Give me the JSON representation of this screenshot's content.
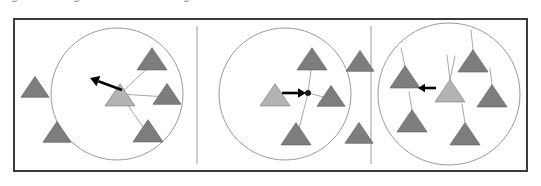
{
  "caption": {
    "text": "Figure: flocking / leader-follower neighbourhood states"
  },
  "figure": {
    "frame": {
      "x": 13,
      "y": 18,
      "w": 515,
      "h": 154,
      "border_color": "#3b3b3b",
      "border_width": 2
    },
    "background_color": "#ffffff",
    "divider_color": "#9a9a9a",
    "dividers": [
      197,
      371
    ],
    "colors": {
      "agent_fill": "#b3b3b3",
      "agent_stroke": "#8c8c8c",
      "neighbor_fill": "#7d7d7d",
      "neighbor_stroke": "#6a6a6a",
      "link": "#a8a8a8",
      "circle_stroke": "#9a9a9a",
      "arrow": "#000000",
      "hub_dot": "#1a1a1a"
    },
    "panels": [
      {
        "id": "panel-1",
        "label": "a",
        "circle": {
          "cx": 117,
          "cy": 94,
          "r": 66
        },
        "hub": null,
        "agent": {
          "x": 120,
          "y": 96,
          "size": 15,
          "rot": 0
        },
        "arrow": {
          "x1": 122,
          "y1": 90,
          "x2": 90,
          "y2": 78,
          "head": 9
        },
        "neighbors_inside": [
          {
            "x": 152,
            "y": 60,
            "size": 15,
            "rot": 0
          },
          {
            "x": 167,
            "y": 95,
            "size": 14,
            "rot": 0
          },
          {
            "x": 148,
            "y": 132,
            "size": 15,
            "rot": 0
          }
        ],
        "neighbors_outside": [
          {
            "x": 35,
            "y": 88,
            "size": 14,
            "rot": 0
          },
          {
            "x": 57,
            "y": 133,
            "size": 14,
            "rot": 0
          }
        ],
        "links": [
          {
            "x1": 120,
            "y1": 94,
            "x2": 152,
            "y2": 64
          },
          {
            "x1": 120,
            "y1": 94,
            "x2": 167,
            "y2": 97
          },
          {
            "x1": 120,
            "y1": 94,
            "x2": 148,
            "y2": 134
          }
        ]
      },
      {
        "id": "panel-2",
        "label": "b",
        "circle": {
          "cx": 285,
          "cy": 94,
          "r": 66
        },
        "hub": {
          "x": 308,
          "y": 93,
          "r": 3
        },
        "agent": {
          "x": 275,
          "y": 96,
          "size": 15,
          "rot": 0
        },
        "arrow": {
          "x1": 282,
          "y1": 93,
          "x2": 306,
          "y2": 93,
          "head": 8
        },
        "neighbors_inside": [
          {
            "x": 312,
            "y": 60,
            "size": 15,
            "rot": 0
          },
          {
            "x": 331,
            "y": 97,
            "size": 14,
            "rot": 0
          },
          {
            "x": 296,
            "y": 135,
            "size": 15,
            "rot": 0
          }
        ],
        "neighbors_outside": [
          {
            "x": 360,
            "y": 62,
            "size": 14,
            "rot": 0
          },
          {
            "x": 359,
            "y": 134,
            "size": 14,
            "rot": 0
          }
        ],
        "links": [
          {
            "x1": 308,
            "y1": 93,
            "x2": 312,
            "y2": 63
          },
          {
            "x1": 308,
            "y1": 93,
            "x2": 331,
            "y2": 99
          },
          {
            "x1": 308,
            "y1": 93,
            "x2": 297,
            "y2": 137
          }
        ]
      },
      {
        "id": "panel-3",
        "label": "c",
        "circle": {
          "cx": 449,
          "cy": 94,
          "r": 71
        },
        "hub": null,
        "agent": {
          "x": 450,
          "y": 92,
          "size": 15,
          "rot": 0
        },
        "arrow": {
          "x1": 436,
          "y1": 88,
          "x2": 418,
          "y2": 88,
          "head": 7
        },
        "neighbors_inside": [
          {
            "x": 405,
            "y": 78,
            "size": 15,
            "rot": 0
          },
          {
            "x": 473,
            "y": 62,
            "size": 15,
            "rot": 0
          },
          {
            "x": 492,
            "y": 97,
            "size": 15,
            "rot": 0
          },
          {
            "x": 412,
            "y": 122,
            "size": 15,
            "rot": 0
          },
          {
            "x": 465,
            "y": 135,
            "size": 15,
            "rot": 0
          }
        ],
        "neighbors_outside": [],
        "tails": [
          {
            "x1": 450,
            "y1": 80,
            "x2": 447,
            "y2": 55
          },
          {
            "x1": 450,
            "y1": 80,
            "x2": 455,
            "y2": 56
          },
          {
            "x1": 405,
            "y1": 66,
            "x2": 401,
            "y2": 48
          },
          {
            "x1": 473,
            "y1": 50,
            "x2": 471,
            "y2": 30
          },
          {
            "x1": 492,
            "y1": 85,
            "x2": 490,
            "y2": 68
          },
          {
            "x1": 412,
            "y1": 110,
            "x2": 409,
            "y2": 92
          },
          {
            "x1": 465,
            "y1": 123,
            "x2": 462,
            "y2": 104
          }
        ],
        "links": []
      }
    ]
  }
}
